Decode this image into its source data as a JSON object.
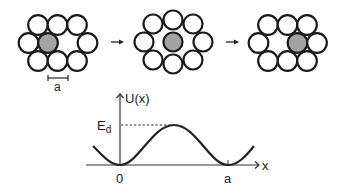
{
  "figure": {
    "panels": [
      {
        "id": "initial",
        "description": "Gray atom left of vacancy"
      },
      {
        "id": "saddle",
        "description": "Gray atom at saddle point between neighbors"
      },
      {
        "id": "final",
        "description": "Gray atom moved into former vacancy site"
      }
    ],
    "arrows": [
      "→",
      "→"
    ],
    "scale_bar_label": "a",
    "plot": {
      "y_axis_label": "U(x)",
      "x_axis_label": "x",
      "energy_label_main": "E",
      "energy_label_sub": "d",
      "tick_labels": [
        "0",
        "a"
      ]
    },
    "colors": {
      "atom_fill": "#ffffff",
      "atom_stroke": "#1a1a1a",
      "moving_atom_fill": "#a3a3a3",
      "line": "#222222"
    }
  }
}
